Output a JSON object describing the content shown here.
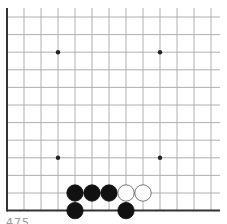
{
  "game": "Go",
  "board": {
    "columns": 13,
    "rows": 12,
    "visible_edges": [
      "left",
      "bottom"
    ],
    "origin_x": 7,
    "origin_y": 17,
    "col_spacing": 17,
    "row_spacing": 17.6,
    "line_color": "#b0b0b0",
    "edge_color": "#333333",
    "star_points": [
      {
        "col": 3,
        "row": 2
      },
      {
        "col": 9,
        "row": 2
      },
      {
        "col": 3,
        "row": 8
      },
      {
        "col": 9,
        "row": 8
      }
    ]
  },
  "stones": [
    {
      "color": "black",
      "col": 4,
      "row": 10
    },
    {
      "color": "black",
      "col": 5,
      "row": 10
    },
    {
      "color": "black",
      "col": 6,
      "row": 10
    },
    {
      "color": "white",
      "col": 7,
      "row": 10
    },
    {
      "color": "white",
      "col": 8,
      "row": 10
    },
    {
      "color": "black",
      "col": 4,
      "row": 11
    },
    {
      "color": "black",
      "col": 7,
      "row": 11
    }
  ],
  "caption": "475"
}
